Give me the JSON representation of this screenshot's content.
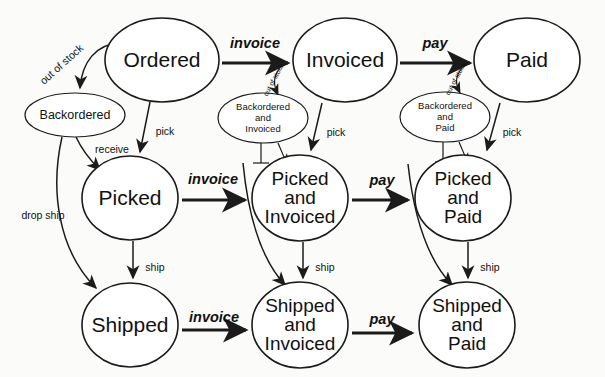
{
  "diagram": {
    "background_color": "#fbfbf9",
    "stroke_color": "#1b1b1b",
    "fill_color": "#ffffff",
    "states": [
      {
        "id": "ordered",
        "label": "Ordered",
        "size": "big",
        "cx": 162,
        "cy": 60,
        "rx": 57,
        "ry": 42
      },
      {
        "id": "invoiced",
        "label": "Invoiced",
        "size": "big",
        "cx": 345,
        "cy": 60,
        "rx": 52,
        "ry": 42
      },
      {
        "id": "paid",
        "label": "Paid",
        "size": "big",
        "cx": 527,
        "cy": 60,
        "rx": 53,
        "ry": 42
      },
      {
        "id": "backordered",
        "label": "Backordered",
        "size": "small-ellipse",
        "cx": 75,
        "cy": 115,
        "rx": 50,
        "ry": 22
      },
      {
        "id": "backordered-and-invoiced",
        "label_lines": [
          "Backordered",
          "and",
          "Invoiced"
        ],
        "size": "small-ellipse",
        "cx": 263,
        "cy": 118,
        "rx": 45,
        "ry": 25
      },
      {
        "id": "backordered-and-paid",
        "label_lines": [
          "Backordered",
          "and",
          "Paid"
        ],
        "size": "small-ellipse",
        "cx": 445,
        "cy": 117,
        "rx": 45,
        "ry": 25
      },
      {
        "id": "picked",
        "label": "Picked",
        "size": "big",
        "cx": 130,
        "cy": 198,
        "rx": 48,
        "ry": 42
      },
      {
        "id": "picked-and-invoiced",
        "label_lines": [
          "Picked",
          "and",
          "Invoiced"
        ],
        "size": "multi",
        "cx": 300,
        "cy": 198,
        "rx": 48,
        "ry": 43
      },
      {
        "id": "picked-and-paid",
        "label_lines": [
          "Picked",
          "and",
          "Paid"
        ],
        "size": "multi",
        "cx": 463,
        "cy": 198,
        "rx": 48,
        "ry": 43
      },
      {
        "id": "shipped",
        "label": "Shipped",
        "size": "big",
        "cx": 130,
        "cy": 325,
        "rx": 48,
        "ry": 42
      },
      {
        "id": "shipped-and-invoiced",
        "label_lines": [
          "Shipped",
          "and",
          "Invoiced"
        ],
        "size": "multi",
        "cx": 300,
        "cy": 325,
        "rx": 48,
        "ry": 43
      },
      {
        "id": "shipped-and-paid",
        "label_lines": [
          "Shipped",
          "and",
          "Paid"
        ],
        "size": "multi",
        "cx": 467,
        "cy": 325,
        "rx": 48,
        "ry": 43
      }
    ],
    "transitions": [
      {
        "id": "ordered-to-backordered",
        "label": "out of stock",
        "weight": "minor",
        "from": "ordered",
        "to": "backordered"
      },
      {
        "id": "ordered-to-invoiced",
        "label": "invoice",
        "weight": "major",
        "from": "ordered",
        "to": "invoiced"
      },
      {
        "id": "invoiced-to-paid",
        "label": "pay",
        "weight": "major",
        "from": "invoiced",
        "to": "paid"
      },
      {
        "id": "ordered-to-picked",
        "label": "pick",
        "weight": "minor",
        "from": "ordered",
        "to": "picked"
      },
      {
        "id": "invoiced-to-picked-and-invoiced",
        "label": "pick",
        "weight": "minor",
        "from": "invoiced",
        "to": "picked-and-invoiced"
      },
      {
        "id": "paid-to-picked-and-paid",
        "label": "pick",
        "weight": "minor",
        "from": "paid",
        "to": "picked-and-paid"
      },
      {
        "id": "backordered-to-picked",
        "label": "receive",
        "weight": "minor",
        "from": "backordered",
        "to": "picked"
      },
      {
        "id": "backordered-to-shipped",
        "label": "drop ship",
        "weight": "minor",
        "from": "backordered",
        "to": "shipped"
      },
      {
        "id": "invoice-to-backordered-and-invoiced",
        "label": "out of stock",
        "weight": "tiny",
        "from": "invoice-edge",
        "to": "backordered-and-invoiced"
      },
      {
        "id": "pay-to-backordered-and-paid",
        "label": "out of stock",
        "weight": "tiny",
        "from": "pay-edge",
        "to": "backordered-and-paid"
      },
      {
        "id": "picked-to-picked-and-invoiced",
        "label": "invoice",
        "weight": "major",
        "from": "picked",
        "to": "picked-and-invoiced"
      },
      {
        "id": "picked-and-invoiced-to-picked-and-paid",
        "label": "pay",
        "weight": "major",
        "from": "picked-and-invoiced",
        "to": "picked-and-paid"
      },
      {
        "id": "picked-to-shipped",
        "label": "ship",
        "weight": "minor",
        "from": "picked",
        "to": "shipped"
      },
      {
        "id": "picked-and-invoiced-to-shipped-and-invoiced",
        "label": "ship",
        "weight": "minor",
        "from": "picked-and-invoiced",
        "to": "shipped-and-invoiced"
      },
      {
        "id": "picked-and-paid-to-shipped-and-paid",
        "label": "ship",
        "weight": "minor",
        "from": "picked-and-paid",
        "to": "shipped-and-paid"
      },
      {
        "id": "shipped-to-shipped-and-invoiced",
        "label": "invoice",
        "weight": "major",
        "from": "shipped",
        "to": "shipped-and-invoiced"
      },
      {
        "id": "shipped-and-invoiced-to-shipped-and-paid",
        "label": "pay",
        "weight": "major",
        "from": "shipped-and-invoiced",
        "to": "shipped-and-paid"
      },
      {
        "id": "picked-to-shipped-and-invoiced-curve",
        "label": "",
        "weight": "thin",
        "from": "invoice-edge-2",
        "to": "shipped-and-invoiced"
      },
      {
        "id": "picked-and-invoiced-to-shipped-and-paid-curve",
        "label": "",
        "weight": "thin",
        "from": "pay-edge-2",
        "to": "shipped-and-paid"
      },
      {
        "id": "backordered-and-invoiced-down-left",
        "label": "",
        "weight": "hair",
        "from": "backordered-and-invoiced",
        "to": "invoice-label"
      },
      {
        "id": "backordered-and-invoiced-down-right",
        "label": "",
        "weight": "hair",
        "from": "backordered-and-invoiced",
        "to": "picked-and-invoiced"
      },
      {
        "id": "backordered-and-paid-down-left",
        "label": "",
        "weight": "hair",
        "from": "backordered-and-paid",
        "to": "pay-label"
      },
      {
        "id": "backordered-and-paid-down-right",
        "label": "",
        "weight": "hair",
        "from": "backordered-and-paid",
        "to": "picked-and-paid"
      }
    ],
    "labels": {
      "out_of_stock": "out of stock",
      "invoice": "invoice",
      "pay": "pay",
      "pick": "pick",
      "receive": "receive",
      "drop_ship": "drop ship",
      "ship": "ship",
      "backordered": "Backordered",
      "and": "and",
      "invoiced_word": "Invoiced",
      "paid_word": "Paid",
      "ordered": "Ordered",
      "invoiced": "Invoiced",
      "paid": "Paid",
      "picked": "Picked",
      "shipped": "Shipped"
    }
  }
}
